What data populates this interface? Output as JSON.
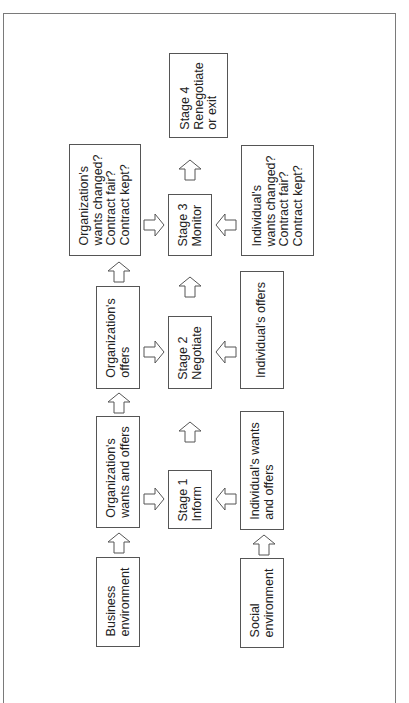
{
  "diagram": {
    "type": "flowchart",
    "orientation": "rotated-90-ccw",
    "columns": {
      "organization": [
        {
          "id": "business_env",
          "label": "Business\nenvironment"
        },
        {
          "id": "org_wants_offers",
          "label": "Organization's\nwants and offers"
        },
        {
          "id": "org_offers",
          "label": "Organization's\noffers"
        },
        {
          "id": "org_wants_changed",
          "label": "Organization's\nwants changed?\nContract fair?\nContract kept?"
        }
      ],
      "stages": [
        {
          "id": "stage1",
          "label": "Stage 1\nInform"
        },
        {
          "id": "stage2",
          "label": "Stage 2\nNegotiate"
        },
        {
          "id": "stage3",
          "label": "Stage 3\nMonitor"
        },
        {
          "id": "stage4",
          "label": "Stage 4\nRenegotiate\nor exit"
        }
      ],
      "individual": [
        {
          "id": "social_env",
          "label": "Social\nenvironment"
        },
        {
          "id": "ind_wants_offers",
          "label": "Individual's wants\nand offers"
        },
        {
          "id": "ind_offers",
          "label": "Individual's offers"
        },
        {
          "id": "ind_wants_changed",
          "label": "Individual's\nwants changed?\nContract fair?\nContract kept?"
        }
      ]
    },
    "edges": [
      {
        "from": "business_env",
        "to": "org_wants_offers"
      },
      {
        "from": "org_wants_offers",
        "to": "org_offers"
      },
      {
        "from": "org_offers",
        "to": "org_wants_changed"
      },
      {
        "from": "social_env",
        "to": "ind_wants_offers"
      },
      {
        "from": "org_wants_offers",
        "to": "stage1"
      },
      {
        "from": "ind_wants_offers",
        "to": "stage1"
      },
      {
        "from": "stage1",
        "to": "stage2"
      },
      {
        "from": "org_offers",
        "to": "stage2"
      },
      {
        "from": "ind_offers",
        "to": "stage2"
      },
      {
        "from": "stage2",
        "to": "stage3"
      },
      {
        "from": "org_wants_changed",
        "to": "stage3"
      },
      {
        "from": "ind_wants_changed",
        "to": "stage3"
      },
      {
        "from": "stage3",
        "to": "stage4"
      }
    ],
    "colors": {
      "border": "#555555",
      "frame": "#7a7a7a",
      "background": "#ffffff"
    }
  }
}
